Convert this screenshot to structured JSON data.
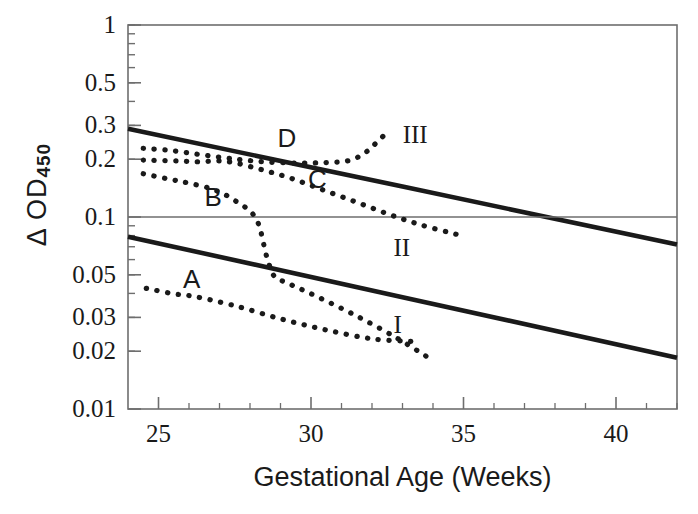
{
  "chart_data": {
    "type": "line",
    "title": "",
    "xlabel": "Gestational Age (Weeks)",
    "ylabel": "Δ  OD",
    "ylabel_sub": "450",
    "yscale": "log",
    "ylim": [
      0.01,
      1
    ],
    "xlim": [
      24.0,
      42.0
    ],
    "ytick_values": [
      1,
      0.5,
      0.3,
      0.2,
      0.1,
      0.05,
      0.03,
      0.02,
      0.01
    ],
    "ytick_labels": [
      "1",
      "0.5",
      "0.3",
      "0.2",
      "0.1",
      "0.05",
      "0.03",
      "0.02",
      "0.01"
    ],
    "xtick_values": [
      25,
      30,
      35,
      40
    ],
    "xtick_labels": [
      "25",
      "30",
      "35",
      "40"
    ],
    "xminor_values": [
      26,
      27,
      28,
      29,
      31,
      32,
      33,
      34,
      36,
      37,
      38,
      39,
      41,
      42
    ],
    "grid": "single horizontal reference line at 0.1",
    "gridline_y": 0.1,
    "legend_position": "inline labels on curves",
    "line_color": "#1a1a1a",
    "axis_color": "#6e6e6e",
    "series": [
      {
        "name": "III",
        "style": "solid",
        "label": "III",
        "label_x": 33.3,
        "label_y": 0.265,
        "points": [
          [
            24.0,
            0.288
          ],
          [
            42.0,
            0.072
          ]
        ]
      },
      {
        "name": "II",
        "style": "reference",
        "label": "II",
        "label_x": 33.0,
        "label_y": 0.068,
        "points": [
          [
            24.0,
            0.1
          ],
          [
            42.0,
            0.1
          ]
        ]
      },
      {
        "name": "I",
        "style": "solid",
        "label": "I",
        "label_x": 33.0,
        "label_y": 0.027,
        "points": [
          [
            24.0,
            0.079
          ],
          [
            42.0,
            0.0185
          ]
        ]
      },
      {
        "name": "A",
        "style": "dotted",
        "label": "A",
        "label_x": 26.1,
        "label_y": 0.047,
        "points": [
          [
            24.6,
            0.0425
          ],
          [
            25.5,
            0.0398
          ],
          [
            26.2,
            0.0385
          ],
          [
            27.5,
            0.0345
          ],
          [
            29.0,
            0.0295
          ],
          [
            30.5,
            0.0258
          ],
          [
            32.0,
            0.0232
          ],
          [
            33.3,
            0.0225
          ]
        ]
      },
      {
        "name": "B",
        "style": "dotted",
        "label": "B",
        "label_x": 26.8,
        "label_y": 0.125,
        "points": [
          [
            24.5,
            0.168
          ],
          [
            25.3,
            0.158
          ],
          [
            26.0,
            0.15
          ],
          [
            26.8,
            0.139
          ],
          [
            27.5,
            0.122
          ],
          [
            28.2,
            0.098
          ],
          [
            28.55,
            0.062
          ],
          [
            28.8,
            0.049
          ],
          [
            29.2,
            0.0455
          ],
          [
            30.2,
            0.0385
          ],
          [
            31.5,
            0.0305
          ],
          [
            32.8,
            0.0235
          ],
          [
            33.9,
            0.0183
          ]
        ]
      },
      {
        "name": "C",
        "style": "dotted",
        "label": "C",
        "label_x": 30.2,
        "label_y": 0.155,
        "points": [
          [
            24.5,
            0.198
          ],
          [
            25.5,
            0.196
          ],
          [
            26.3,
            0.194
          ],
          [
            27.0,
            0.196
          ],
          [
            27.6,
            0.19
          ],
          [
            28.4,
            0.176
          ],
          [
            29.3,
            0.16
          ],
          [
            30.3,
            0.14
          ],
          [
            31.4,
            0.121
          ],
          [
            32.5,
            0.104
          ],
          [
            33.6,
            0.091
          ],
          [
            34.8,
            0.081
          ]
        ]
      },
      {
        "name": "D",
        "style": "dotted",
        "label": "D",
        "label_x": 29.2,
        "label_y": 0.255,
        "points": [
          [
            24.5,
            0.228
          ],
          [
            25.4,
            0.222
          ],
          [
            26.3,
            0.212
          ],
          [
            27.1,
            0.204
          ],
          [
            27.8,
            0.198
          ],
          [
            28.6,
            0.193
          ],
          [
            29.6,
            0.191
          ],
          [
            30.5,
            0.192
          ],
          [
            31.2,
            0.196
          ],
          [
            31.7,
            0.212
          ],
          [
            32.1,
            0.24
          ],
          [
            32.45,
            0.272
          ]
        ]
      }
    ]
  },
  "geometry": {
    "plot_left": 128,
    "plot_right": 677,
    "plot_top": 25,
    "plot_bottom": 409
  }
}
